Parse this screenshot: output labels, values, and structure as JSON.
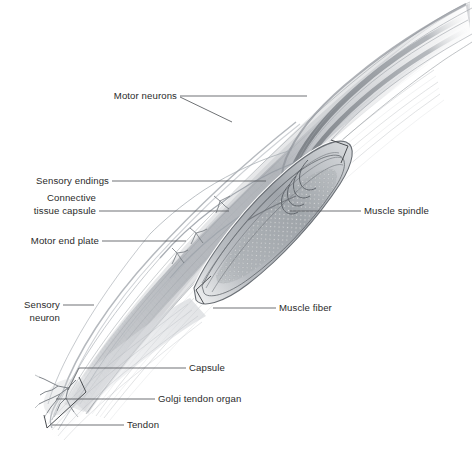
{
  "figure": {
    "background_color": "#ffffff",
    "ink_color": "#2b2b2b",
    "leader_color": "#55585c"
  },
  "labels": {
    "motor_neurons": "Motor neurons",
    "sensory_endings": "Sensory endings",
    "connective_line1": "Connective",
    "connective_line2": "tissue capsule",
    "motor_end_plate": "Motor end plate",
    "sensory_neuron_line1": "Sensory",
    "sensory_neuron_line2": "neuron",
    "muscle_spindle": "Muscle spindle",
    "muscle_fiber": "Muscle fiber",
    "capsule": "Capsule",
    "golgi_tendon_organ": "Golgi tendon organ",
    "tendon": "Tendon"
  },
  "structures": [
    {
      "name": "muscle-belly",
      "description": "fusiform skeletal muscle running lower-left to upper-right"
    },
    {
      "name": "muscle-spindle",
      "description": "encapsulated spindle-shaped stretch receptor in muscle belly"
    },
    {
      "name": "intrafusal-fibers",
      "description": "nuclear bag and chain fibers inside the spindle capsule"
    },
    {
      "name": "golgi-tendon-organ",
      "description": "branching sensory arborization at the tendon junction"
    },
    {
      "name": "tendon",
      "description": "tapered tendon at lower-left pole of the muscle"
    },
    {
      "name": "motor-neuron-axons",
      "description": "nerve fibers descending from upper right into the muscle"
    },
    {
      "name": "sensory-neuron-axon",
      "description": "afferent fiber running along the left edge of the muscle"
    },
    {
      "name": "motor-end-plates",
      "description": "small branched nerve terminals on extrafusal muscle fibers"
    }
  ]
}
